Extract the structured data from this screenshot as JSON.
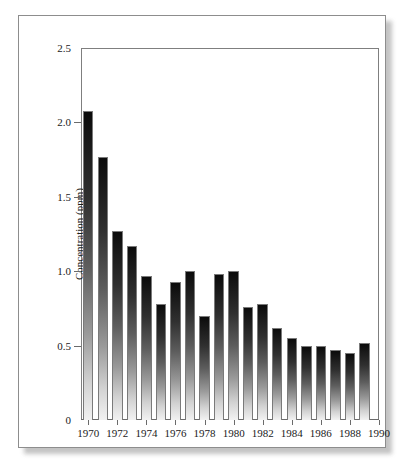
{
  "chart_data": {
    "type": "bar",
    "title": "",
    "xlabel": "",
    "ylabel": "Concentration (ppm)",
    "ylim": [
      0,
      2.5
    ],
    "xlim": [
      1969.5,
      1990.0
    ],
    "grid": false,
    "legend": "none",
    "ytick_labels": [
      "2.5",
      "2.0",
      "1.5",
      "1.0",
      "0.5",
      "0"
    ],
    "ytick_values": [
      2.5,
      2.0,
      1.5,
      1.0,
      0.5,
      0
    ],
    "xtick_labels": [
      "1970",
      "1972",
      "1974",
      "1976",
      "1978",
      "1980",
      "1982",
      "1984",
      "1986",
      "1988",
      "1990"
    ],
    "xtick_values": [
      1970,
      1972,
      1974,
      1976,
      1978,
      1980,
      1982,
      1984,
      1986,
      1988,
      1990
    ],
    "categories": [
      1970,
      1971,
      1972,
      1973,
      1974,
      1975,
      1976,
      1977,
      1978,
      1979,
      1980,
      1981,
      1982,
      1983,
      1984,
      1985,
      1986,
      1987,
      1988,
      1989
    ],
    "values": [
      2.08,
      1.77,
      1.27,
      1.17,
      0.97,
      0.78,
      0.93,
      1.0,
      0.7,
      0.98,
      1.0,
      0.76,
      0.78,
      0.62,
      0.55,
      0.5,
      0.5,
      0.47,
      0.45,
      0.52
    ],
    "bar_fill": "black-to-white-vertical-gradient",
    "bar_edge_color": "#7a7a7a"
  },
  "figure": {
    "background": "#ffffff",
    "frame_color": "#8d8d8d",
    "has_drop_shadow": true
  }
}
